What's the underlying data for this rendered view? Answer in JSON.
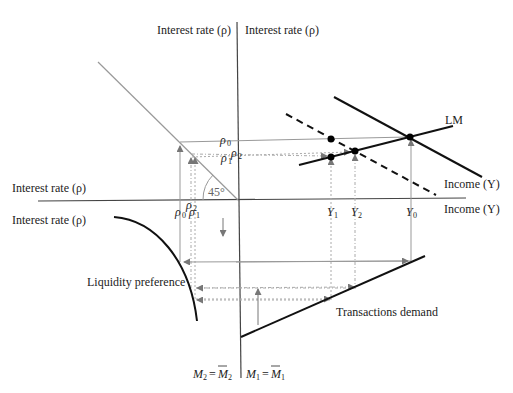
{
  "diagram": {
    "type": "IS-LM four-quadrant derivation",
    "colors": {
      "axis": "#444444",
      "curve": "#111111",
      "guide": "#999999",
      "dot": "#000000"
    },
    "labels": {
      "top_left_axis": "Interest rate (ρ)",
      "top_right_axis": "Interest rate (ρ)",
      "left_upper_axis": "Interest rate (ρ)",
      "left_lower_axis": "Interest rate (ρ)",
      "income_upper": "Income (Y)",
      "income_lower": "Income (Y)",
      "lm": "LM",
      "angle": "45°",
      "liquidity_preference": "Liquidity preference",
      "transactions_demand": "Transactions demand",
      "m2_eq": "M₂ = M̄₂",
      "m1_eq": "M₁ = M̄₁"
    },
    "rates": {
      "rho0": "ρ0",
      "rho1": "ρ1",
      "rho2": "ρ2"
    },
    "incomes": {
      "y0": "Y0",
      "y1": "Y1",
      "y2": "Y2"
    }
  }
}
